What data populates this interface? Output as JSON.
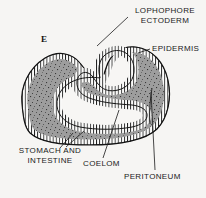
{
  "figure": {
    "panel_letter": "E",
    "background_color": "#f6f5f3",
    "ink_color": "#1a1a1a",
    "tissue_fill_color": "#9c9c9c",
    "cavity_fill_color": "#f6f5f3"
  },
  "labels": {
    "lophophore_ectoderm_line1": "LOPHOPHORE",
    "lophophore_ectoderm_line2": "ECTODERM",
    "epidermis": "EPIDERMIS",
    "stomach_and_intestine_line1": "STOMACH  AND",
    "stomach_and_intestine_line2": "INTESTINE",
    "coelom": "COELOM",
    "peritoneum": "PERITONEUM"
  }
}
